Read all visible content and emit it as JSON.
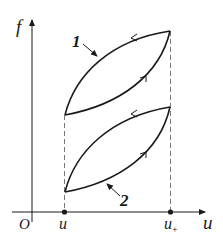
{
  "diagram": {
    "type": "hysteresis-loop-plot",
    "axes": {
      "y_label": "f",
      "x_label": "u",
      "origin_label": "O"
    },
    "ticks": [
      {
        "label": "u",
        "subscript": "",
        "x": 64
      },
      {
        "label": "u",
        "subscript": "+",
        "x": 170
      }
    ],
    "curves": [
      {
        "id": "1",
        "label": "1",
        "direction_upper": "right-to-left",
        "direction_lower": "left-to-right"
      },
      {
        "id": "2",
        "label": "2",
        "direction_upper": "right-to-left",
        "direction_lower": "left-to-right"
      }
    ],
    "colors": {
      "line": "#1a1a1a",
      "dashed": "#555555",
      "background": "#ffffff"
    }
  }
}
